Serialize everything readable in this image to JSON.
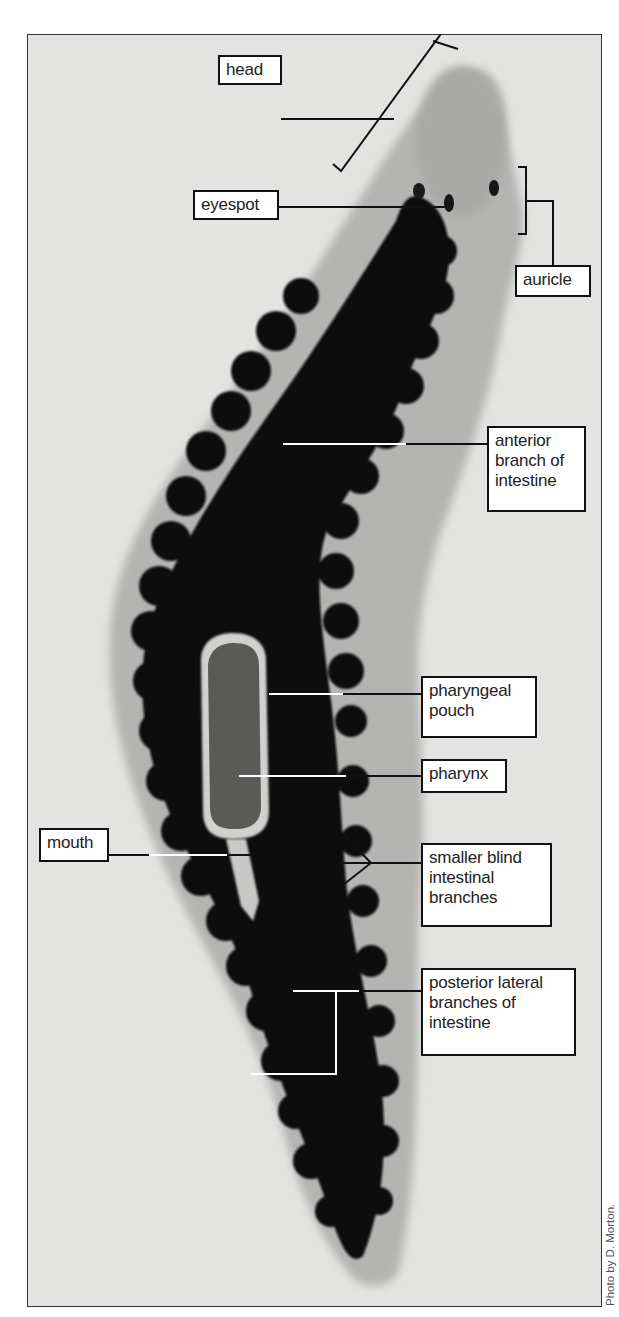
{
  "figure": {
    "labels": {
      "head": "head",
      "eyespot": "eyespot",
      "auricle": "auricle",
      "anterior_branch": "anterior\nbranch of\nintestine",
      "pharyngeal_pouch": "pharyngeal\npouch",
      "pharynx": "pharynx",
      "mouth": "mouth",
      "smaller_blind": "smaller blind\nintestinal\nbranches",
      "posterior_lateral": "posterior lateral\nbranches of\nintestine"
    },
    "credit": "Photo by D. Morton.",
    "colors": {
      "background": "#e3e3e1",
      "body": "#b4b4b2",
      "intestine": "#0e0e0e",
      "pharynx": "#5a5a58",
      "leader_dark": "#111111",
      "leader_light": "#ffffff"
    }
  }
}
